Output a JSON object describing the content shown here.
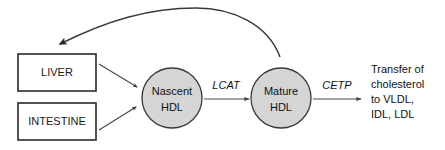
{
  "diagram": {
    "background_color": "#ffffff",
    "stroke_color": "#3a3a3a",
    "circle_fill_color": "#d5d5d5",
    "text_color": "#111111",
    "source_boxes": [
      {
        "id": "liver",
        "label": "LIVER"
      },
      {
        "id": "intestine",
        "label": "INTESTINE"
      }
    ],
    "particles": [
      {
        "id": "nascent-hdl",
        "line1": "Nascent",
        "line2": "HDL"
      },
      {
        "id": "mature-hdl",
        "line1": "Mature",
        "line2": "HDL"
      }
    ],
    "enzymes": [
      {
        "id": "lcat",
        "label": "LCAT"
      },
      {
        "id": "cetp",
        "label": "CETP"
      }
    ],
    "outcome": {
      "id": "transfer-outcome",
      "line1": "Transfer of",
      "line2": "cholesterol",
      "line3": "to VLDL,",
      "line4": "IDL, LDL"
    }
  }
}
